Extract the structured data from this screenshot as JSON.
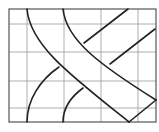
{
  "diagram": {
    "type": "grid-with-crossing-bands",
    "canvas": {
      "width": 159,
      "height": 132
    },
    "frame": {
      "x": 9,
      "y": 9,
      "width": 147,
      "height": 113
    },
    "grid": {
      "columns": 5,
      "rows": 5,
      "vertical_lines_x": [
        27,
        64,
        101,
        138
      ],
      "horizontal_lines_y": [
        24,
        52,
        81,
        108
      ]
    },
    "colors": {
      "background": "#ffffff",
      "grid": "#9a9a9a",
      "frame": "#555555",
      "band_outline": "#222222"
    },
    "bands": [
      {
        "name": "band-top-left-to-bottom-right",
        "layer": "over",
        "edges": [
          "M27,9 C30,45 70,75 129,122",
          "M63,9 C66,40 100,65 156,100"
        ],
        "end_cap": "M129,122 L156,100"
      },
      {
        "name": "band-bottom-left-to-top-right",
        "layer": "under",
        "edges": [
          "M27,122 C27,100 40,80 59,67",
          "M84,43 L128,9",
          "M63,122 C63,108 72,96 83,88",
          "M110,64 L155,29"
        ]
      }
    ]
  }
}
